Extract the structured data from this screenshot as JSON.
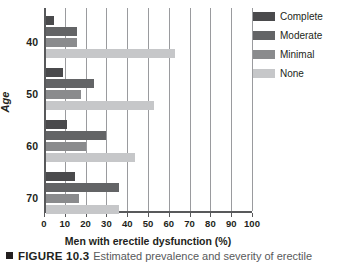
{
  "figure": {
    "marker_icon": "square-bullet-icon",
    "number_label": "FIGURE 10.3",
    "caption_text": "Estimated prevalence and severity of erectile"
  },
  "legend": {
    "position": "top-right",
    "entries": [
      {
        "label": "Complete",
        "color": "#4a4a4c",
        "key": "complete"
      },
      {
        "label": "Moderate",
        "color": "#636466",
        "key": "moderate"
      },
      {
        "label": "Minimal",
        "color": "#8a8b8d",
        "key": "minimal"
      },
      {
        "label": "None",
        "color": "#c6c7c9",
        "key": "none"
      }
    ]
  },
  "axes": {
    "x_ticks": [
      "0",
      "10",
      "20",
      "30",
      "40",
      "50",
      "60",
      "70",
      "80",
      "90",
      "100"
    ],
    "y_ticks": [
      "40",
      "50",
      "60",
      "70"
    ],
    "x_title": "Men with erectile dysfunction (%)",
    "y_title": "Age"
  },
  "chart_data": {
    "type": "bar",
    "orientation": "horizontal",
    "xlabel": "Men with erectile dysfunction (%)",
    "ylabel": "Age",
    "xlim": [
      0,
      100
    ],
    "xticks": [
      0,
      10,
      20,
      30,
      40,
      50,
      60,
      70,
      80,
      90,
      100
    ],
    "categories": [
      "40",
      "50",
      "60",
      "70"
    ],
    "grid": "vertical",
    "legend_position": "top-right",
    "series": [
      {
        "name": "Complete",
        "color": "#4a4a4c",
        "values": [
          4,
          8,
          10,
          14
        ]
      },
      {
        "name": "Moderate",
        "color": "#636466",
        "values": [
          15,
          23,
          29,
          35
        ]
      },
      {
        "name": "Minimal",
        "color": "#8a8b8d",
        "values": [
          15,
          17,
          19,
          16
        ]
      },
      {
        "name": "None",
        "color": "#c6c7c9",
        "values": [
          62,
          52,
          43,
          35
        ]
      }
    ]
  }
}
